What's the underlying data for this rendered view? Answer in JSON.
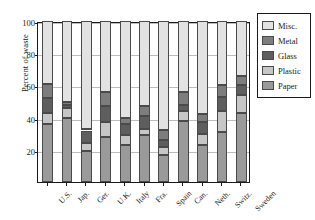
{
  "chart_data": {
    "type": "bar",
    "subtype": "stacked-bar-100-percent",
    "title": "",
    "xlabel": "",
    "ylabel": "Percent of waste",
    "ylim": [
      0,
      100
    ],
    "yticks": [
      20,
      40,
      60,
      80,
      100
    ],
    "ytick_labels": [
      "20",
      "40",
      "60",
      "80",
      "100"
    ],
    "grid": true,
    "grid_axis": "y",
    "legend_position": "right",
    "legend_entries": [
      "Misc.",
      "Metal",
      "Glass",
      "Plastic",
      "Paper"
    ],
    "stack_order_bottom_to_top": [
      "Paper",
      "Plastic",
      "Glass",
      "Metal",
      "Misc."
    ],
    "categories": [
      "U.S.",
      "Jap.",
      "Ger.",
      "U.K.",
      "Italy",
      "Fra.",
      "Spain",
      "Can.",
      "Neth.",
      "Switz.",
      "Sweden"
    ],
    "series": [
      {
        "name": "Paper",
        "color": "#9a9a9a",
        "values": [
          36,
          40,
          19,
          28,
          23,
          29,
          17,
          38,
          23,
          31,
          43
        ]
      },
      {
        "name": "Plastic",
        "color": "#c6c6c6",
        "values": [
          7,
          6,
          5,
          9,
          6,
          4,
          5,
          6,
          7,
          13,
          11
        ]
      },
      {
        "name": "Glass",
        "color": "#5e5e5e",
        "values": [
          9,
          2,
          8,
          10,
          7,
          8,
          4,
          4,
          7,
          9,
          6
        ]
      },
      {
        "name": "Metal",
        "color": "#7d7d7d",
        "values": [
          9,
          2,
          1,
          9,
          4,
          6,
          6,
          8,
          5,
          7,
          6
        ]
      },
      {
        "name": "Misc.",
        "color": "#e2e2e2",
        "values": [
          39,
          50,
          67,
          44,
          60,
          53,
          68,
          44,
          58,
          40,
          34
        ]
      }
    ],
    "cumulative_tops": {
      "U.S.": [
        36,
        43,
        52,
        61,
        100
      ],
      "Jap.": [
        40,
        46,
        48,
        50,
        100
      ],
      "Ger.": [
        19,
        24,
        32,
        33,
        100
      ],
      "U.K.": [
        28,
        37,
        47,
        56,
        100
      ],
      "Italy": [
        23,
        29,
        36,
        40,
        100
      ],
      "Fra.": [
        29,
        33,
        41,
        47,
        100
      ],
      "Spain": [
        17,
        22,
        26,
        32,
        100
      ],
      "Can.": [
        38,
        44,
        48,
        56,
        100
      ],
      "Neth.": [
        23,
        30,
        37,
        42,
        100
      ],
      "Switz.": [
        31,
        44,
        53,
        60,
        100
      ],
      "Sweden": [
        43,
        54,
        60,
        66,
        100
      ]
    }
  },
  "colors": {
    "misc": "#e2e2e2",
    "metal": "#7d7d7d",
    "glass": "#5e5e5e",
    "plastic": "#c6c6c6",
    "paper": "#9a9a9a",
    "axis": "#1a1a1a",
    "grid": "#bdbdbd",
    "edge": "#4a4a4a",
    "background": "#ffffff"
  },
  "legend": {
    "items": [
      {
        "label": "Misc.",
        "color": "#e2e2e2"
      },
      {
        "label": "Metal",
        "color": "#7d7d7d"
      },
      {
        "label": "Glass",
        "color": "#5e5e5e"
      },
      {
        "label": "Plastic",
        "color": "#c6c6c6"
      },
      {
        "label": "Paper",
        "color": "#9a9a9a"
      }
    ]
  }
}
